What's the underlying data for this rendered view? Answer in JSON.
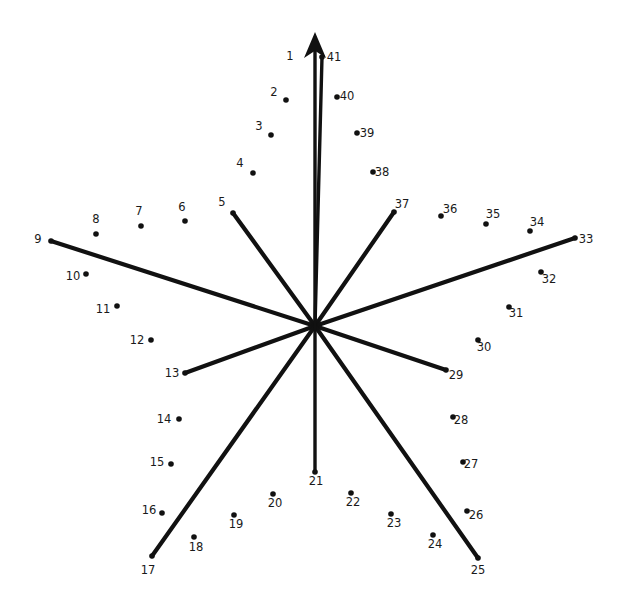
{
  "figure": {
    "kind": "radial-dot-to-dot-star-diagram",
    "title": "",
    "background_color": "#ffffff",
    "ink_color": "#111111",
    "label_color": "#1a1a1a",
    "center": {
      "x": 315,
      "y": 326
    },
    "arrow": {
      "name": "north-arrow",
      "from": {
        "x": 315,
        "y": 326
      },
      "to": {
        "x": 315,
        "y": 32
      },
      "head_width": 22,
      "head_length": 26,
      "stroke_width": 3.4
    },
    "spoke_stroke_width": 4.2,
    "dot_radius": 2.8,
    "spokes": [
      {
        "id": "spoke-1-41",
        "label_left": "1",
        "label_right": "41",
        "to_point": 41
      },
      {
        "id": "spoke-5",
        "to_point": 5
      },
      {
        "id": "spoke-9",
        "to_point": 9
      },
      {
        "id": "spoke-13",
        "to_point": 13
      },
      {
        "id": "spoke-17",
        "to_point": 17
      },
      {
        "id": "spoke-21",
        "to_point": 21
      },
      {
        "id": "spoke-25",
        "to_point": 25
      },
      {
        "id": "spoke-29",
        "to_point": 29
      },
      {
        "id": "spoke-33",
        "to_point": 33
      },
      {
        "id": "spoke-37",
        "to_point": 37
      }
    ],
    "points": [
      {
        "n": "1",
        "label": "1",
        "lx": 290,
        "ly": 60,
        "dot": false,
        "spoke": true,
        "dx": 315,
        "dy": 326
      },
      {
        "n": "41",
        "label": "41",
        "lx": 334,
        "ly": 61,
        "dot": true,
        "spoke": true,
        "dx": 322,
        "dy": 57
      },
      {
        "n": "2",
        "label": "2",
        "lx": 274,
        "ly": 96,
        "dot": true,
        "dx": 286,
        "dy": 100
      },
      {
        "n": "40",
        "label": "40",
        "lx": 347,
        "ly": 100,
        "dot": true,
        "dx": 337,
        "dy": 97
      },
      {
        "n": "3",
        "label": "3",
        "lx": 259,
        "ly": 130,
        "dot": true,
        "dx": 271,
        "dy": 135
      },
      {
        "n": "39",
        "label": "39",
        "lx": 367,
        "ly": 137,
        "dot": true,
        "dx": 357,
        "dy": 133
      },
      {
        "n": "4",
        "label": "4",
        "lx": 240,
        "ly": 167,
        "dot": true,
        "dx": 253,
        "dy": 173
      },
      {
        "n": "38",
        "label": "38",
        "lx": 382,
        "ly": 176,
        "dot": true,
        "dx": 373,
        "dy": 172
      },
      {
        "n": "5",
        "label": "5",
        "lx": 222,
        "ly": 206,
        "dot": true,
        "spoke": true,
        "dx": 233,
        "dy": 213
      },
      {
        "n": "37",
        "label": "37",
        "lx": 402,
        "ly": 208,
        "dot": true,
        "spoke": true,
        "dx": 394,
        "dy": 212
      },
      {
        "n": "6",
        "label": "6",
        "lx": 182,
        "ly": 211,
        "dot": true,
        "dx": 185,
        "dy": 221
      },
      {
        "n": "36",
        "label": "36",
        "lx": 450,
        "ly": 213,
        "dot": true,
        "dx": 441,
        "dy": 216
      },
      {
        "n": "7",
        "label": "7",
        "lx": 139,
        "ly": 215,
        "dot": true,
        "dx": 141,
        "dy": 226
      },
      {
        "n": "35",
        "label": "35",
        "lx": 493,
        "ly": 218,
        "dot": true,
        "dx": 486,
        "dy": 224
      },
      {
        "n": "8",
        "label": "8",
        "lx": 96,
        "ly": 223,
        "dot": true,
        "dx": 96,
        "dy": 234
      },
      {
        "n": "34",
        "label": "34",
        "lx": 537,
        "ly": 226,
        "dot": true,
        "dx": 530,
        "dy": 231
      },
      {
        "n": "9",
        "label": "9",
        "lx": 38,
        "ly": 243,
        "dot": true,
        "spoke": true,
        "dx": 51,
        "dy": 241
      },
      {
        "n": "33",
        "label": "33",
        "lx": 586,
        "ly": 243,
        "dot": true,
        "spoke": true,
        "dx": 575,
        "dy": 238
      },
      {
        "n": "10",
        "label": "10",
        "lx": 73,
        "ly": 280,
        "dot": true,
        "dx": 86,
        "dy": 274
      },
      {
        "n": "32",
        "label": "32",
        "lx": 549,
        "ly": 283,
        "dot": true,
        "dx": 541,
        "dy": 272
      },
      {
        "n": "11",
        "label": "11",
        "lx": 103,
        "ly": 313,
        "dot": true,
        "dx": 117,
        "dy": 306
      },
      {
        "n": "31",
        "label": "31",
        "lx": 516,
        "ly": 317,
        "dot": true,
        "dx": 509,
        "dy": 307
      },
      {
        "n": "12",
        "label": "12",
        "lx": 137,
        "ly": 344,
        "dot": true,
        "dx": 151,
        "dy": 340
      },
      {
        "n": "30",
        "label": "30",
        "lx": 484,
        "ly": 351,
        "dot": true,
        "dx": 478,
        "dy": 340
      },
      {
        "n": "13",
        "label": "13",
        "lx": 172,
        "ly": 377,
        "dot": true,
        "spoke": true,
        "dx": 185,
        "dy": 373
      },
      {
        "n": "29",
        "label": "29",
        "lx": 456,
        "ly": 379,
        "dot": true,
        "spoke": true,
        "dx": 446,
        "dy": 370
      },
      {
        "n": "14",
        "label": "14",
        "lx": 164,
        "ly": 423,
        "dot": true,
        "dx": 179,
        "dy": 419
      },
      {
        "n": "28",
        "label": "28",
        "lx": 461,
        "ly": 424,
        "dot": true,
        "dx": 453,
        "dy": 417
      },
      {
        "n": "15",
        "label": "15",
        "lx": 157,
        "ly": 466,
        "dot": true,
        "dx": 171,
        "dy": 464
      },
      {
        "n": "27",
        "label": "27",
        "lx": 471,
        "ly": 468,
        "dot": true,
        "dx": 463,
        "dy": 462
      },
      {
        "n": "16",
        "label": "16",
        "lx": 149,
        "ly": 514,
        "dot": true,
        "dx": 162,
        "dy": 513
      },
      {
        "n": "26",
        "label": "26",
        "lx": 476,
        "ly": 519,
        "dot": true,
        "dx": 467,
        "dy": 511
      },
      {
        "n": "17",
        "label": "17",
        "lx": 148,
        "ly": 574,
        "dot": true,
        "spoke": true,
        "dx": 152,
        "dy": 556
      },
      {
        "n": "25",
        "label": "25",
        "lx": 478,
        "ly": 574,
        "dot": true,
        "spoke": true,
        "dx": 478,
        "dy": 558
      },
      {
        "n": "18",
        "label": "18",
        "lx": 196,
        "ly": 551,
        "dot": true,
        "dx": 194,
        "dy": 537
      },
      {
        "n": "24",
        "label": "24",
        "lx": 435,
        "ly": 548,
        "dot": true,
        "dx": 433,
        "dy": 535
      },
      {
        "n": "19",
        "label": "19",
        "lx": 236,
        "ly": 528,
        "dot": true,
        "dx": 234,
        "dy": 515
      },
      {
        "n": "23",
        "label": "23",
        "lx": 394,
        "ly": 527,
        "dot": true,
        "dx": 391,
        "dy": 514
      },
      {
        "n": "20",
        "label": "20",
        "lx": 275,
        "ly": 507,
        "dot": true,
        "dx": 273,
        "dy": 494
      },
      {
        "n": "22",
        "label": "22",
        "lx": 353,
        "ly": 506,
        "dot": true,
        "dx": 351,
        "dy": 493
      },
      {
        "n": "21",
        "label": "21",
        "lx": 316,
        "ly": 485,
        "dot": true,
        "spoke": true,
        "dx": 315,
        "dy": 472
      }
    ]
  }
}
